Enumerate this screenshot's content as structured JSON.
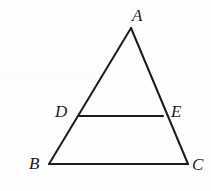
{
  "figure": {
    "kind": "geometry-diagram",
    "background_color": "#fefefe",
    "stroke_color": "#1b1b1b",
    "stroke_width": 2,
    "label_color": "#1b1b1b",
    "canvas": {
      "width": 211,
      "height": 191
    },
    "points": {
      "A": {
        "label": "A",
        "x": 131,
        "y": 28,
        "label_x": 132,
        "label_y": 7
      },
      "B": {
        "label": "B",
        "x": 49,
        "y": 164,
        "label_x": 29,
        "label_y": 155
      },
      "C": {
        "label": "C",
        "x": 188,
        "y": 164,
        "label_x": 192,
        "label_y": 156
      },
      "D": {
        "label": "D",
        "x": 79,
        "y": 116,
        "label_x": 55,
        "label_y": 103
      },
      "E": {
        "label": "E",
        "x": 163,
        "y": 116,
        "label_x": 171,
        "label_y": 103
      }
    },
    "segments": [
      {
        "name": "side-ab",
        "from": "A",
        "to": "B"
      },
      {
        "name": "side-ac",
        "from": "A",
        "to": "C"
      },
      {
        "name": "base-bc",
        "from": "B",
        "to": "C"
      },
      {
        "name": "midsegment-de",
        "from": "D",
        "to": "E"
      }
    ]
  }
}
